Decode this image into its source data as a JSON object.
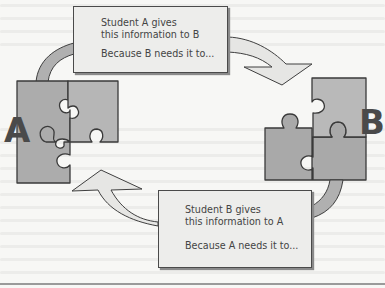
{
  "diagram": {
    "colors": {
      "background": "#f7f7f5",
      "box_fill": "#ededeb",
      "puzzle_fill_dark": "#a9a9a9",
      "puzzle_fill_light": "#b8b8b8",
      "arrow_fill": "#e6e6e4",
      "small_arrow_fill": "#b0b0b0",
      "outline": "#3f3f3f"
    },
    "nodes": [
      {
        "id": "A",
        "label": "A",
        "shape": "jigsaw-puzzle-pieces"
      },
      {
        "id": "B",
        "label": "B",
        "shape": "jigsaw-puzzle-pieces"
      }
    ],
    "box_a_to_b": {
      "line1": "Student A gives",
      "line2": "this information to B",
      "line3": "Because B needs it to..."
    },
    "box_b_to_a": {
      "line1": "Student B gives",
      "line2": "this information to A",
      "line3": "Because A needs it to..."
    },
    "edges": [
      {
        "from": "A",
        "to": "B",
        "via": "box_a_to_b",
        "direction": "clockwise-top"
      },
      {
        "from": "B",
        "to": "A",
        "via": "box_b_to_a",
        "direction": "clockwise-bottom"
      }
    ]
  }
}
